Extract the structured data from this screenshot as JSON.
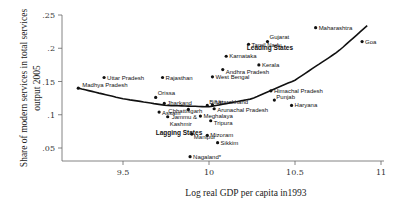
{
  "chart_data": {
    "type": "scatter",
    "title": "",
    "xlabel": "Log real GDP per capita in1993",
    "ylabel": "Share of modern services in total services output 2005",
    "xlim": [
      9.2,
      11.0
    ],
    "ylim": [
      0.03,
      0.25
    ],
    "xticks": [
      9.5,
      10,
      10.5,
      11
    ],
    "xtick_labels": [
      "9.5",
      "10",
      "10.5",
      "11"
    ],
    "yticks": [
      0.05,
      0.1,
      0.15,
      0.2,
      0.25
    ],
    "ytick_labels": [
      ".05",
      ".1",
      ".15",
      ".2",
      ".25"
    ],
    "grid": false,
    "legend": null,
    "annotations": [
      {
        "text": "Leading States",
        "x": 10.22,
        "y": 0.197
      },
      {
        "text": "Lagging States",
        "x": 9.69,
        "y": 0.069
      }
    ],
    "fit_line": {
      "type": "quadratic",
      "points": [
        [
          9.24,
          0.14
        ],
        [
          9.5,
          0.124
        ],
        [
          9.75,
          0.114
        ],
        [
          10.0,
          0.112
        ],
        [
          10.25,
          0.124
        ],
        [
          10.5,
          0.152
        ],
        [
          10.75,
          0.195
        ],
        [
          10.92,
          0.234
        ]
      ]
    },
    "points": [
      {
        "label": "Madhya Pradesh",
        "x": 9.24,
        "y": 0.14
      },
      {
        "label": "Uttar Pradesh",
        "x": 9.39,
        "y": 0.156
      },
      {
        "label": "Rajasthan",
        "x": 9.73,
        "y": 0.156
      },
      {
        "label": "West Bengal",
        "x": 10.02,
        "y": 0.157
      },
      {
        "label": "Andhra Pradesh",
        "x": 10.08,
        "y": 0.168
      },
      {
        "label": "Kerala",
        "x": 10.29,
        "y": 0.175
      },
      {
        "label": "Karnataka",
        "x": 10.1,
        "y": 0.188
      },
      {
        "label": "Tamil Nadu",
        "x": 10.23,
        "y": 0.206
      },
      {
        "label": "Gujarat",
        "x": 10.34,
        "y": 0.21
      },
      {
        "label": "Maharashtra",
        "x": 10.62,
        "y": 0.231
      },
      {
        "label": "Goa",
        "x": 10.89,
        "y": 0.21
      },
      {
        "label": "Himachal Pradesh",
        "x": 10.36,
        "y": 0.136
      },
      {
        "label": "Punjab",
        "x": 10.38,
        "y": 0.122
      },
      {
        "label": "Haryana",
        "x": 10.48,
        "y": 0.114
      },
      {
        "label": "Orissa",
        "x": 9.69,
        "y": 0.126
      },
      {
        "label": "Jharkand",
        "x": 9.74,
        "y": 0.117
      },
      {
        "label": "Assam",
        "x": 9.71,
        "y": 0.104
      },
      {
        "label": "Chhattisgarh",
        "x": 9.88,
        "y": 0.108
      },
      {
        "label": "Bihar",
        "x": 9.99,
        "y": 0.114
      },
      {
        "label": "Uttarakhand",
        "x": 10.02,
        "y": 0.115
      },
      {
        "label": "Arunachal Pradesh",
        "x": 10.03,
        "y": 0.109
      },
      {
        "label": "Jammu & Kashmir",
        "x": 9.76,
        "y": 0.097
      },
      {
        "label": "Meghalaya",
        "x": 9.95,
        "y": 0.098
      },
      {
        "label": "Tripura",
        "x": 10.01,
        "y": 0.091
      },
      {
        "label": "Manipur",
        "x": 9.9,
        "y": 0.071
      },
      {
        "label": "Mizoram",
        "x": 9.99,
        "y": 0.069
      },
      {
        "label": "Sikkim",
        "x": 10.05,
        "y": 0.058
      },
      {
        "label": "Nagaland*",
        "x": 9.89,
        "y": 0.037
      }
    ]
  },
  "axes": {
    "ylabel_line1": "Share of modern services in total services",
    "ylabel_line2": "output 2005",
    "xlabel": "Log real GDP per capita in1993"
  }
}
